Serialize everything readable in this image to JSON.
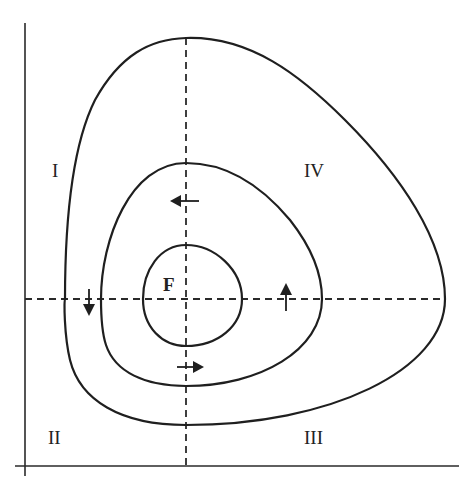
{
  "diagram": {
    "type": "phase-plane-closed-orbits",
    "center_label": "F",
    "quadrant_labels": {
      "top_left": "I",
      "top_right": "IV",
      "bottom_left": "II",
      "bottom_right": "III"
    },
    "orbits": [
      {
        "name": "outer",
        "top": [
          186,
          38
        ],
        "right": [
          445,
          299
        ],
        "bottom": [
          186,
          425
        ],
        "left": [
          65,
          299
        ]
      },
      {
        "name": "middle",
        "top": [
          186,
          163
        ],
        "right": [
          322,
          299
        ],
        "bottom": [
          186,
          386
        ],
        "left": [
          101,
          299
        ]
      },
      {
        "name": "inner",
        "top": [
          186,
          245
        ],
        "right": [
          242,
          299
        ],
        "bottom": [
          186,
          346
        ],
        "left": [
          143,
          299
        ]
      }
    ],
    "flow_direction": "counter-clockwise",
    "arrows": [
      {
        "position": "top-middle-orbit",
        "direction": "left"
      },
      {
        "position": "left-middle-orbit",
        "direction": "down"
      },
      {
        "position": "bottom-middle-orbit",
        "direction": "right"
      },
      {
        "position": "right-middle-orbit",
        "direction": "up"
      }
    ],
    "colors": {
      "line": "#1f1f1f",
      "background": "#ffffff"
    }
  }
}
